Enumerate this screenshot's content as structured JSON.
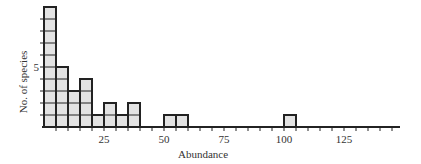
{
  "chart_data": {
    "type": "bar",
    "subtype": "histogram",
    "title": "",
    "xlabel": "Abundance",
    "ylabel": "No. of species",
    "bin_width": 5,
    "bins": [
      {
        "start": 0,
        "end": 5,
        "value": 10
      },
      {
        "start": 5,
        "end": 10,
        "value": 5
      },
      {
        "start": 10,
        "end": 15,
        "value": 3
      },
      {
        "start": 15,
        "end": 20,
        "value": 4
      },
      {
        "start": 20,
        "end": 25,
        "value": 1
      },
      {
        "start": 25,
        "end": 30,
        "value": 2
      },
      {
        "start": 30,
        "end": 35,
        "value": 1
      },
      {
        "start": 35,
        "end": 40,
        "value": 2
      },
      {
        "start": 50,
        "end": 55,
        "value": 1
      },
      {
        "start": 55,
        "end": 60,
        "value": 1
      },
      {
        "start": 100,
        "end": 105,
        "value": 1
      }
    ],
    "x_ticks": [
      25,
      50,
      75,
      100,
      125
    ],
    "x_minor_tick_step": 5,
    "y_ticks": [
      5
    ],
    "y_minor_tick_step": 1,
    "xlim": [
      0,
      148
    ],
    "ylim": [
      0,
      10
    ],
    "grid": false,
    "legend": null,
    "colors": {
      "bar_fill": "#e3e3e3",
      "bar_stroke": "#222222",
      "axis": "#222222"
    }
  }
}
